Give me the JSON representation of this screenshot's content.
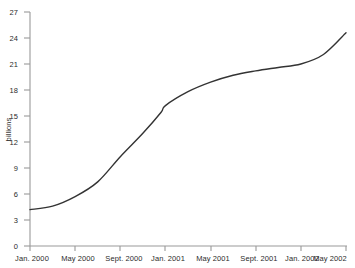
{
  "chart_data": {
    "type": "line",
    "title": "",
    "subtitle": "",
    "xlabel": "",
    "ylabel": "billions",
    "ylim": [
      0,
      27
    ],
    "yticks": [
      0,
      3,
      6,
      9,
      12,
      15,
      18,
      21,
      24,
      27
    ],
    "ytick_labels": [
      "0",
      "3",
      "6",
      "9",
      "12",
      "15",
      "18",
      "21",
      "24",
      "27"
    ],
    "categories": [
      "Jan. 2000",
      "May 2000",
      "Sept. 2000",
      "Jan. 2001",
      "May 2001",
      "Sept. 2001",
      "Jan. 2002",
      "May 2002"
    ],
    "xtick_labels": [
      "Jan. 2000",
      "May 2000",
      "Sept. 2000",
      "Jan. 2001",
      "May 2001",
      "Sept. 2001",
      "Jan. 2002",
      "May 2002"
    ],
    "grid": false,
    "legend": false,
    "legend_position": "none",
    "line_color": "#333333",
    "axis_color": "#999999",
    "background_color": "#ffffff",
    "series": [
      {
        "name": "billions",
        "values_at_ticks": [
          4.2,
          5.7,
          10.3,
          16.2,
          18.9,
          20.2,
          21.0,
          24.6
        ],
        "points": [
          {
            "x": 0.0,
            "y": 4.2
          },
          {
            "x": 0.5,
            "y": 4.6
          },
          {
            "x": 1.0,
            "y": 5.7
          },
          {
            "x": 1.5,
            "y": 7.4
          },
          {
            "x": 2.0,
            "y": 10.3
          },
          {
            "x": 2.5,
            "y": 13.0
          },
          {
            "x": 2.9,
            "y": 15.4
          },
          {
            "x": 3.0,
            "y": 16.2
          },
          {
            "x": 3.5,
            "y": 17.8
          },
          {
            "x": 4.0,
            "y": 18.9
          },
          {
            "x": 4.5,
            "y": 19.7
          },
          {
            "x": 5.0,
            "y": 20.2
          },
          {
            "x": 5.5,
            "y": 20.6
          },
          {
            "x": 6.0,
            "y": 21.0
          },
          {
            "x": 6.5,
            "y": 22.1
          },
          {
            "x": 7.0,
            "y": 24.6
          }
        ]
      }
    ]
  }
}
